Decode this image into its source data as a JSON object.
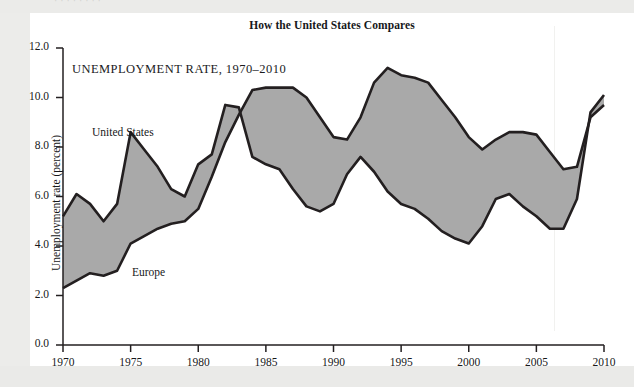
{
  "page": {
    "ghost_top_text": "· ·   ·   ·    ·    ·   · ·",
    "background_color": "#e9e9e7",
    "card_color": "#ffffff"
  },
  "figure": {
    "title": "How the United States Compares",
    "subtitle": "UNEMPLOYMENT RATE, 1970–2010"
  },
  "chart_data": {
    "type": "line",
    "title": "How the United States Compares",
    "subtitle": "UNEMPLOYMENT RATE, 1970–2010",
    "xlabel": "",
    "ylabel": "Unemployment rate (percent)",
    "xlim": [
      1970,
      2010
    ],
    "ylim": [
      0.0,
      12.0
    ],
    "ytick_labels": [
      "0.0",
      "2.0",
      "4.0",
      "6.0",
      "8.0",
      "10.0",
      "12.0"
    ],
    "yticks": [
      0.0,
      2.0,
      4.0,
      6.0,
      8.0,
      10.0,
      12.0
    ],
    "xtick_labels": [
      "1970",
      "1975",
      "1980",
      "1985",
      "1990",
      "1995",
      "2000",
      "2005",
      "2010"
    ],
    "xticks": [
      1970,
      1975,
      1980,
      1985,
      1990,
      1995,
      2000,
      2005,
      2010
    ],
    "grid": false,
    "legend_position": "inline-annotations",
    "fill_between_color": "#a8a8a8",
    "line_color": "#231f20",
    "annotations": [
      {
        "text": "United States",
        "x": 1972.5,
        "y": 9.35
      },
      {
        "text": "Europe",
        "x": 1975.8,
        "y": 3.65
      }
    ],
    "x": [
      1970,
      1971,
      1972,
      1973,
      1974,
      1975,
      1976,
      1977,
      1978,
      1979,
      1980,
      1981,
      1982,
      1983,
      1984,
      1985,
      1986,
      1987,
      1988,
      1989,
      1990,
      1991,
      1992,
      1993,
      1994,
      1995,
      1996,
      1997,
      1998,
      1999,
      2000,
      2001,
      2002,
      2003,
      2004,
      2005,
      2006,
      2007,
      2008,
      2009,
      2010
    ],
    "series": [
      {
        "name": "United States",
        "values": [
          5.2,
          6.1,
          5.7,
          5.0,
          5.7,
          8.6,
          7.9,
          7.2,
          6.3,
          6.0,
          7.3,
          7.7,
          9.7,
          9.6,
          7.6,
          7.3,
          7.1,
          6.3,
          5.6,
          5.4,
          5.7,
          6.9,
          7.6,
          7.0,
          6.2,
          5.7,
          5.5,
          5.1,
          4.6,
          4.3,
          4.1,
          4.8,
          5.9,
          6.1,
          5.6,
          5.2,
          4.7,
          4.7,
          5.9,
          9.4,
          10.1
        ]
      },
      {
        "name": "Europe",
        "values": [
          2.3,
          2.6,
          2.9,
          2.8,
          3.0,
          4.1,
          4.4,
          4.7,
          4.9,
          5.0,
          5.5,
          6.8,
          8.2,
          9.3,
          10.3,
          10.4,
          10.4,
          10.4,
          10.0,
          9.2,
          8.4,
          8.3,
          9.2,
          10.6,
          11.2,
          10.9,
          10.8,
          10.6,
          9.9,
          9.2,
          8.4,
          7.9,
          8.3,
          8.6,
          8.6,
          8.5,
          7.8,
          7.1,
          7.2,
          9.2,
          9.7
        ]
      }
    ]
  }
}
